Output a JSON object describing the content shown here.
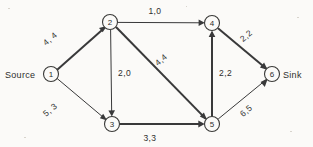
{
  "diagram": {
    "ink_color": "#39393a",
    "background_color": "#fbfaf8",
    "terminals": {
      "source_label": "Source",
      "sink_label": "Sink"
    },
    "nodes": [
      {
        "id": "1",
        "label": "1",
        "x": 51,
        "y": 74,
        "r": 7.5
      },
      {
        "id": "2",
        "label": "2",
        "x": 110,
        "y": 22,
        "r": 7.5
      },
      {
        "id": "3",
        "label": "3",
        "x": 112,
        "y": 124,
        "r": 7.5
      },
      {
        "id": "4",
        "label": "4",
        "x": 212,
        "y": 23,
        "r": 7.5
      },
      {
        "id": "5",
        "label": "5",
        "x": 212,
        "y": 124,
        "r": 7.5
      },
      {
        "id": "6",
        "label": "6",
        "x": 272,
        "y": 74,
        "r": 7.5
      }
    ],
    "edges": [
      {
        "from": "1",
        "to": "2",
        "label": "4, 4",
        "capacity": 4,
        "flow": 4,
        "weight": "bold",
        "label_x": 52,
        "label_y": 41
      },
      {
        "from": "1",
        "to": "3",
        "label": "5, 3",
        "capacity": 5,
        "flow": 3,
        "weight": "thin",
        "label_x": 52,
        "label_y": 112
      },
      {
        "from": "2",
        "to": "4",
        "label": "1,0",
        "capacity": 1,
        "flow": 0,
        "weight": "thin",
        "label_x": 155,
        "label_y": 14
      },
      {
        "from": "2",
        "to": "3",
        "label": "2,0",
        "capacity": 2,
        "flow": 0,
        "weight": "thin",
        "label_x": 118,
        "label_y": 76
      },
      {
        "from": "2",
        "to": "5",
        "label": "4,4",
        "capacity": 4,
        "flow": 4,
        "weight": "bold",
        "label_x": 163,
        "label_y": 62
      },
      {
        "from": "3",
        "to": "5",
        "label": "3,3",
        "capacity": 3,
        "flow": 3,
        "weight": "bold",
        "label_x": 150,
        "label_y": 141
      },
      {
        "from": "5",
        "to": "4",
        "label": "2,2",
        "capacity": 2,
        "flow": 2,
        "weight": "bold",
        "label_x": 219,
        "label_y": 76
      },
      {
        "from": "4",
        "to": "6",
        "label": "2,2",
        "capacity": 2,
        "flow": 2,
        "weight": "bold",
        "label_x": 248,
        "label_y": 38
      },
      {
        "from": "5",
        "to": "6",
        "label": "6,5",
        "capacity": 6,
        "flow": 5,
        "weight": "thin",
        "label_x": 248,
        "label_y": 113
      }
    ]
  }
}
